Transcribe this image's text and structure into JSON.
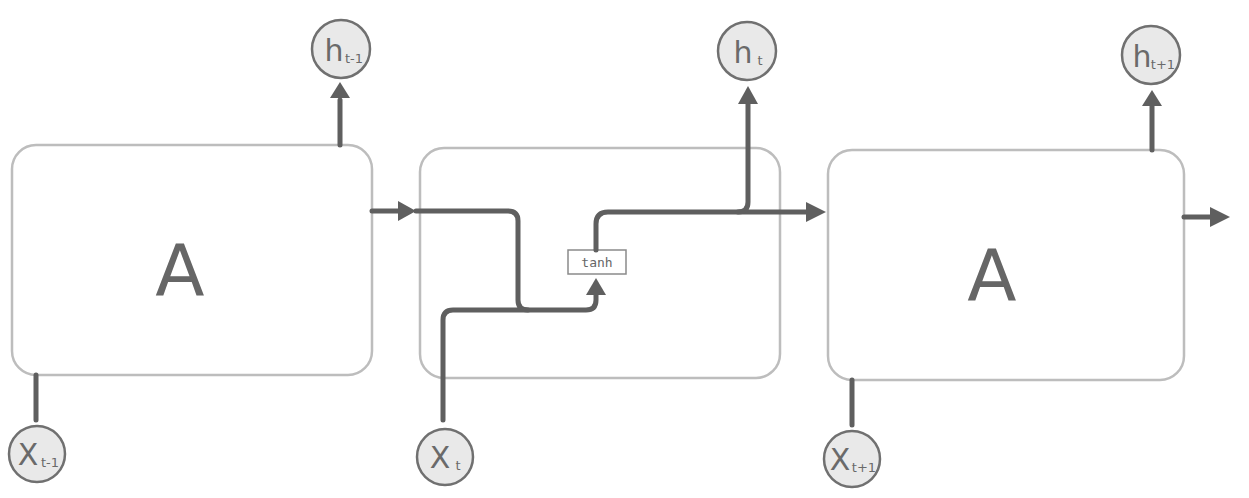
{
  "diagram": {
    "cells": [
      {
        "id": "cell-prev",
        "label": "A",
        "input": {
          "main": "X",
          "sub": "t-1"
        },
        "output": {
          "main": "h",
          "sub": "t-1"
        },
        "expanded": false
      },
      {
        "id": "cell-current",
        "label": "",
        "input": {
          "main": "X",
          "sub": "t"
        },
        "output": {
          "main": "h",
          "sub": "t"
        },
        "expanded": true,
        "activation": "tanh"
      },
      {
        "id": "cell-next",
        "label": "A",
        "input": {
          "main": "X",
          "sub": "t+1"
        },
        "output": {
          "main": "h",
          "sub": "t+1"
        },
        "expanded": false
      }
    ],
    "colors": {
      "box_stroke": "#bdbdbd",
      "arrow": "#5f5f5f",
      "node_fill": "#e9e9e9",
      "node_stroke": "#707070",
      "text": "#666666"
    }
  }
}
